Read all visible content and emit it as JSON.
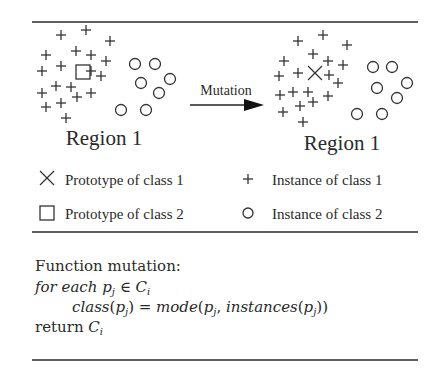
{
  "diagram": {
    "arrow_label": "Mutation",
    "left_panel": {
      "label": "Region 1"
    },
    "right_panel": {
      "label": "Region 1"
    }
  },
  "legend": {
    "items": [
      {
        "symbol": "x-cross",
        "label": "Prototype of class 1"
      },
      {
        "symbol": "plus",
        "label": "Instance of class 1"
      },
      {
        "symbol": "square",
        "label": "Prototype of class 2"
      },
      {
        "symbol": "circle",
        "label": "Instance of class 2"
      }
    ]
  },
  "algorithm": {
    "title": "Function mutation:",
    "line1_keyword": "for each ",
    "line1_var": "p",
    "line1_sub": "j",
    "line1_in": " ∈ ",
    "line1_set": "C",
    "line1_set_sub": "i",
    "line2": "class(p_j) = mode(p_j, instances(p_j))",
    "line3_keyword": "return ",
    "line3_set": "C",
    "line3_set_sub": "i"
  },
  "points": {
    "left_plus": [
      [
        61,
        35
      ],
      [
        86,
        30
      ],
      [
        110,
        41
      ],
      [
        46,
        55
      ],
      [
        76,
        51
      ],
      [
        91,
        55
      ],
      [
        106,
        61
      ],
      [
        42,
        71
      ],
      [
        61,
        66
      ],
      [
        91,
        71
      ],
      [
        101,
        76
      ],
      [
        42,
        93
      ],
      [
        56,
        86
      ],
      [
        71,
        87
      ],
      [
        77,
        97
      ],
      [
        91,
        93
      ],
      [
        46,
        107
      ],
      [
        61,
        103
      ],
      [
        66,
        118
      ]
    ],
    "left_circle": [
      [
        135,
        64
      ],
      [
        155,
        64
      ],
      [
        141,
        83
      ],
      [
        170,
        79
      ],
      [
        159,
        93
      ],
      [
        121,
        110
      ],
      [
        146,
        110
      ]
    ],
    "left_square": [
      83,
      72
    ],
    "right_plus": [
      [
        298,
        41
      ],
      [
        323,
        35
      ],
      [
        347,
        45
      ],
      [
        284,
        61
      ],
      [
        313,
        54
      ],
      [
        328,
        61
      ],
      [
        343,
        65
      ],
      [
        279,
        76
      ],
      [
        298,
        73
      ],
      [
        329,
        75
      ],
      [
        338,
        83
      ],
      [
        280,
        95
      ],
      [
        293,
        92
      ],
      [
        308,
        92
      ],
      [
        313,
        102
      ],
      [
        328,
        96
      ],
      [
        283,
        112
      ],
      [
        300,
        106
      ],
      [
        303,
        122
      ]
    ],
    "right_circle": [
      [
        373,
        67
      ],
      [
        392,
        67
      ],
      [
        377,
        88
      ],
      [
        407,
        83
      ],
      [
        397,
        98
      ],
      [
        357,
        114
      ],
      [
        382,
        114
      ]
    ],
    "right_x": [
      315,
      73
    ]
  }
}
